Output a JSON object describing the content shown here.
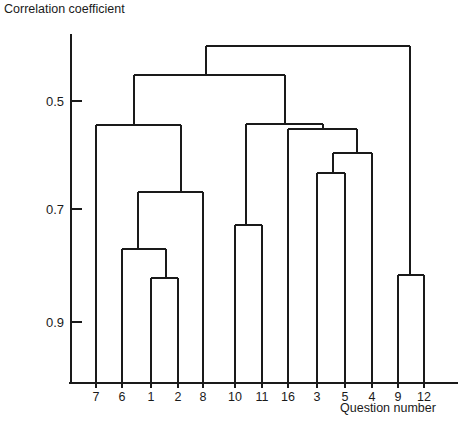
{
  "chart_data": {
    "type": "dendrogram",
    "title": "Correlation coefficient",
    "ylabel": "Correlation coefficient",
    "xlabel": "Question number",
    "grid": false,
    "legend": null,
    "y_axis": {
      "tick_labels": [
        "0.5",
        "0.7",
        "0.9"
      ],
      "tick_values": [
        0.5,
        0.7,
        0.9
      ],
      "direction": "inverted",
      "axis_top_value": 0.35,
      "axis_bottom_value": 1.02
    },
    "leaves": [
      "7",
      "6",
      "1",
      "2",
      "8",
      "10",
      "11",
      "16",
      "3",
      "5",
      "4",
      "9",
      "12"
    ],
    "leaf_x": [
      72,
      96,
      122,
      148,
      177,
      205,
      233,
      262,
      289,
      317,
      345,
      373,
      398,
      424
    ],
    "merges": [
      {
        "name": "merge-1-2",
        "members": [
          "1",
          "2"
        ],
        "height": 0.8,
        "left": "1",
        "right": "2"
      },
      {
        "name": "merge-6-12",
        "members": [
          "6",
          "1",
          "2"
        ],
        "height": 0.75,
        "left": "6",
        "right": "merge-1-2"
      },
      {
        "name": "merge-612-8",
        "members": [
          "6",
          "1",
          "2",
          "8"
        ],
        "height": 0.665,
        "left": "merge-6-12",
        "right": "8"
      },
      {
        "name": "merge-7-rest",
        "members": [
          "7",
          "6",
          "1",
          "2",
          "8"
        ],
        "height": 0.545,
        "left": "7",
        "right": "merge-612-8"
      },
      {
        "name": "merge-10-11",
        "members": [
          "10",
          "11"
        ],
        "height": 0.715,
        "left": "10",
        "right": "11"
      },
      {
        "name": "merge-3-5",
        "members": [
          "3",
          "5"
        ],
        "height": 0.625,
        "left": "3",
        "right": "5"
      },
      {
        "name": "merge-35-4",
        "members": [
          "3",
          "5",
          "4"
        ],
        "height": 0.59,
        "left": "merge-3-5",
        "right": "4"
      },
      {
        "name": "merge-16-354",
        "members": [
          "16",
          "3",
          "5",
          "4"
        ],
        "height": 0.545,
        "left": "16",
        "right": "merge-35-4"
      },
      {
        "name": "merge-1011-16354",
        "members": [
          "10",
          "11",
          "16",
          "3",
          "5",
          "4"
        ],
        "height": 0.537,
        "left": "merge-10-11",
        "right": "merge-16-354"
      },
      {
        "name": "merge-left-right",
        "members": [
          "7",
          "6",
          "1",
          "2",
          "8",
          "10",
          "11",
          "16",
          "3",
          "5",
          "4"
        ],
        "height": 0.455,
        "left": "merge-7-rest",
        "right": "merge-1011-16354"
      },
      {
        "name": "merge-9-12",
        "members": [
          "9",
          "12"
        ],
        "height": 0.785,
        "left": "9",
        "right": "12"
      },
      {
        "name": "root",
        "members": [
          "all"
        ],
        "height": 0.4,
        "left": "merge-left-right",
        "right": "merge-9-12"
      }
    ]
  },
  "axis": {
    "y_title": "Correlation coefficient",
    "x_title": "Question number",
    "ticks": [
      {
        "label": "0.5",
        "y": 101
      },
      {
        "label": "0.7",
        "y": 209
      },
      {
        "label": "0.9",
        "y": 322
      }
    ]
  },
  "leaf_labels": [
    "7",
    "6",
    "1",
    "2",
    "8",
    "10",
    "11",
    "16",
    "3",
    "5",
    "4",
    "9",
    "12"
  ],
  "colors": {
    "line": "#1a1a1a",
    "background": "#ffffff",
    "text": "#1a1a1a"
  },
  "geometry": {
    "axis_x": 71,
    "axis_top_y": 34,
    "baseline_y": 383,
    "baseline_x_start": 69,
    "baseline_x_end": 458,
    "leaf_bottom_y": 383,
    "leaf_x": [
      72,
      96,
      122,
      148,
      177,
      205,
      233,
      262,
      289,
      317,
      345,
      373,
      398,
      424
    ],
    "nodes": [
      {
        "name": "root",
        "y": 46,
        "x1": 206,
        "x2": 410
      },
      {
        "name": "merge-left-right",
        "y": 75,
        "x1": 134,
        "x2": 285
      },
      {
        "name": "merge-7-rest",
        "y": 125,
        "x1": 96,
        "x2": 181
      },
      {
        "name": "merge-612-8",
        "y": 192,
        "x1": 138,
        "x2": 203
      },
      {
        "name": "merge-6-12",
        "y": 249,
        "x1": 122,
        "x2": 166
      },
      {
        "name": "merge-1-2",
        "y": 278,
        "x1": 151,
        "x2": 178
      },
      {
        "name": "merge-1011-16354",
        "y": 124,
        "x1": 246,
        "x2": 323
      },
      {
        "name": "merge-16-354",
        "y": 129,
        "x1": 288,
        "x2": 357
      },
      {
        "name": "merge-35-4",
        "y": 153,
        "x1": 333,
        "x2": 372
      },
      {
        "name": "merge-3-5",
        "y": 173,
        "x1": 317,
        "x2": 345
      },
      {
        "name": "merge-10-11",
        "y": 225,
        "x1": 235,
        "x2": 262
      },
      {
        "name": "merge-9-12",
        "y": 275,
        "x1": 398,
        "x2": 424
      }
    ]
  }
}
